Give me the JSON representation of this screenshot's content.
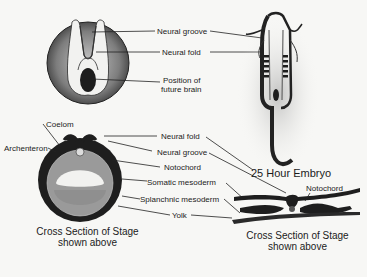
{
  "diagram": {
    "top_left_view": {
      "labels": {
        "neural_groove": "Neural groove",
        "neural_fold": "Neural fold",
        "future_brain_line1": "Position of",
        "future_brain_line2": "future brain"
      }
    },
    "embryo": {
      "title": "25 Hour Embryo"
    },
    "left_cross_section": {
      "labels": {
        "coelom": "Coelom",
        "archenteron": "Archenteron",
        "neural_fold": "Neural fold",
        "neural_groove": "Neural groove",
        "notochord": "Notochord",
        "somatic_mesoderm": "Somatic mesoderm",
        "splanchnic_mesoderm": "Splanchnic mesoderm",
        "yolk": "Yolk"
      },
      "caption_line1": "Cross Section of Stage",
      "caption_line2": "shown above"
    },
    "right_cross_section": {
      "labels": {
        "notochord": "Notochord"
      },
      "caption_line1": "Cross Section of Stage",
      "caption_line2": "shown above"
    },
    "colors": {
      "ink": "#1b1b1b",
      "paper": "#f7f7f5"
    }
  }
}
